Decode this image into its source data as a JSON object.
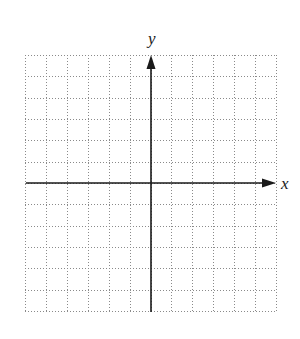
{
  "diagram": {
    "type": "coordinate-grid",
    "x_label": "x",
    "y_label": "y",
    "grid": {
      "columns": 12,
      "rows": 12,
      "left": 25,
      "top": 55,
      "right": 276,
      "bottom": 311,
      "line_style": "dotted",
      "line_color": "#8a8a8a"
    },
    "origin": {
      "x": 151,
      "y": 183
    },
    "axis_color": "#1a1a1a",
    "x_axis": {
      "from": 26,
      "to": 276
    },
    "y_axis": {
      "from": 312,
      "to": 55
    },
    "x_label_pos": {
      "x": 281,
      "y": 189
    },
    "y_label_pos": {
      "x": 148,
      "y": 44
    }
  }
}
